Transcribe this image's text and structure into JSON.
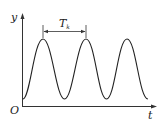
{
  "figure": {
    "axis_x_label": "t",
    "axis_y_label": "y",
    "origin_label": "O",
    "period_label_main": "T",
    "period_label_sub": "k",
    "curve_description": "periodic oscillation with three peaks",
    "line_color": "#222222",
    "peaks": 3
  }
}
